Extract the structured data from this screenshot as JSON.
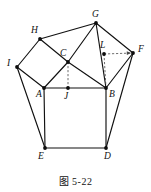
{
  "figure": {
    "caption": "图 5-22",
    "width": 151,
    "height": 192,
    "stroke_color": "#111111",
    "guide_color": "#4a4a4a",
    "background": "#ffffff",
    "vertices": [
      {
        "id": "G",
        "label": "G",
        "x": 96,
        "y": 23,
        "label_x": 92,
        "label_y": 10
      },
      {
        "id": "H",
        "label": "H",
        "x": 40,
        "y": 39,
        "label_x": 31,
        "label_y": 26
      },
      {
        "id": "F",
        "label": "F",
        "x": 133,
        "y": 53,
        "label_x": 138,
        "label_y": 45
      },
      {
        "id": "L",
        "label": "L",
        "x": 104,
        "y": 54,
        "label_x": 100,
        "label_y": 41
      },
      {
        "id": "C",
        "label": "C",
        "x": 68,
        "y": 62,
        "label_x": 60,
        "label_y": 49
      },
      {
        "id": "I",
        "label": "I",
        "x": 17,
        "y": 67,
        "label_x": 7,
        "label_y": 59
      },
      {
        "id": "A",
        "label": "A",
        "x": 44,
        "y": 88,
        "label_x": 36,
        "label_y": 90
      },
      {
        "id": "J",
        "label": "J",
        "x": 68,
        "y": 88,
        "label_x": 64,
        "label_y": 92
      },
      {
        "id": "B",
        "label": "B",
        "x": 106,
        "y": 88,
        "label_x": 109,
        "label_y": 90
      },
      {
        "id": "E",
        "label": "E",
        "x": 45,
        "y": 148,
        "label_x": 38,
        "label_y": 152
      },
      {
        "id": "D",
        "label": "D",
        "x": 106,
        "y": 148,
        "label_x": 104,
        "label_y": 152
      }
    ],
    "edges": [
      {
        "from": "I",
        "to": "H",
        "name": "edge-I-H"
      },
      {
        "from": "H",
        "to": "C",
        "name": "edge-H-C"
      },
      {
        "from": "C",
        "to": "A",
        "name": "edge-C-A"
      },
      {
        "from": "A",
        "to": "I",
        "name": "edge-A-I"
      },
      {
        "from": "H",
        "to": "G",
        "name": "edge-H-G"
      },
      {
        "from": "G",
        "to": "C",
        "name": "edge-G-C"
      },
      {
        "from": "C",
        "to": "B",
        "name": "edge-C-B"
      },
      {
        "from": "G",
        "to": "B",
        "name": "edge-G-B"
      },
      {
        "from": "G",
        "to": "F",
        "name": "edge-G-F"
      },
      {
        "from": "F",
        "to": "B",
        "name": "edge-F-B"
      },
      {
        "from": "A",
        "to": "B",
        "name": "edge-A-B"
      },
      {
        "from": "A",
        "to": "E",
        "name": "edge-A-E"
      },
      {
        "from": "E",
        "to": "D",
        "name": "edge-E-D"
      },
      {
        "from": "D",
        "to": "B",
        "name": "edge-D-B"
      },
      {
        "from": "I",
        "to": "E",
        "name": "edge-I-E"
      },
      {
        "from": "F",
        "to": "D",
        "name": "edge-F-D"
      }
    ],
    "guides": [
      {
        "name": "guide-C-J",
        "from": "C",
        "to": "J",
        "arrow": "none"
      },
      {
        "name": "guide-L-B",
        "from": "L",
        "to": "B",
        "arrow": "none"
      },
      {
        "name": "guide-L-F",
        "from": "L",
        "to": "F",
        "arrow": "end"
      }
    ]
  }
}
